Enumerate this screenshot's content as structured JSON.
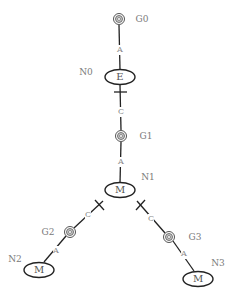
{
  "diagram": {
    "colors": {
      "line": "#222222",
      "target_ring": "#555555",
      "target_fill": "#b0b0b0",
      "label": "#7a7a7a",
      "background": "#ffffff"
    },
    "goals": [
      {
        "id": "G0",
        "label": "G0",
        "x": 119,
        "y": 19,
        "lx": 142,
        "ly": 19
      },
      {
        "id": "G1",
        "label": "G1",
        "x": 121,
        "y": 136,
        "lx": 146,
        "ly": 136
      },
      {
        "id": "G2",
        "label": "G2",
        "x": 70,
        "y": 232,
        "lx": 48,
        "ly": 232
      },
      {
        "id": "G3",
        "label": "G3",
        "x": 169,
        "y": 237,
        "lx": 195,
        "ly": 237
      }
    ],
    "nodes": [
      {
        "id": "N0",
        "label": "N0",
        "text": "E",
        "x": 120,
        "y": 77,
        "lx": 86,
        "ly": 72
      },
      {
        "id": "N1",
        "label": "N1",
        "text": "M",
        "x": 120,
        "y": 190,
        "lx": 148,
        "ly": 177
      },
      {
        "id": "N2",
        "label": "N2",
        "text": "M",
        "x": 39,
        "y": 270,
        "lx": 15,
        "ly": 259
      },
      {
        "id": "N3",
        "label": "N3",
        "text": "M",
        "x": 198,
        "y": 279,
        "lx": 218,
        "ly": 263
      }
    ],
    "edges": [
      {
        "from": "G0",
        "to": "N0",
        "label": "A",
        "lx": 120,
        "ly": 50
      },
      {
        "from": "N0",
        "to": "G1",
        "label": "C",
        "lx": 121,
        "ly": 112,
        "tee": "N0"
      },
      {
        "from": "G1",
        "to": "N1",
        "label": "A",
        "lx": 121,
        "ly": 162
      },
      {
        "from": "N1",
        "to": "G2",
        "label": "C",
        "lx": 88,
        "ly": 215,
        "tee": "N1"
      },
      {
        "from": "G2",
        "to": "N2",
        "label": "A",
        "lx": 56,
        "ly": 251
      },
      {
        "from": "N1",
        "to": "G3",
        "label": "C",
        "lx": 151,
        "ly": 219,
        "tee": "N1"
      },
      {
        "from": "G3",
        "to": "N3",
        "label": "A",
        "lx": 184,
        "ly": 254
      }
    ]
  }
}
